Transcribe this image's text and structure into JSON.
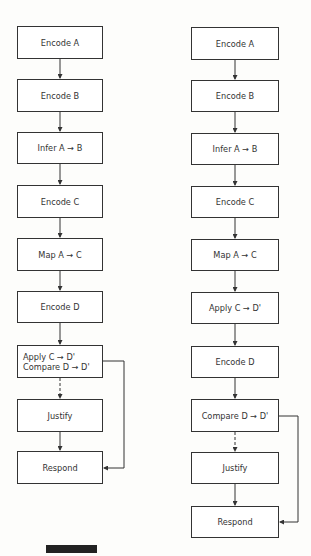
{
  "diagram": {
    "left_flow": {
      "steps": [
        "Encode A",
        "Encode B",
        "Infer A → B",
        "Encode C",
        "Map A → C",
        "Encode D",
        "Apply C → D'",
        "Justify",
        "Respond"
      ],
      "combined_step_line1": "Apply C → D'",
      "combined_step_line2": "Compare D → D'"
    },
    "right_flow": {
      "steps": [
        "Encode A",
        "Encode B",
        "Infer A → B",
        "Encode C",
        "Map A → C",
        "Apply C → D'",
        "Encode D",
        "Compare D → D'",
        "Justify",
        "Respond"
      ]
    },
    "colors": {
      "line": "#333333",
      "bar": "#222222",
      "background": "#fdfdfb"
    }
  }
}
